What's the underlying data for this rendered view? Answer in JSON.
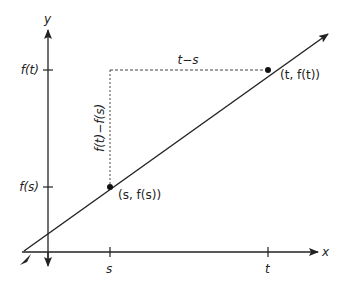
{
  "diagram": {
    "axes": {
      "x_label": "x",
      "y_label": "y"
    },
    "ticks": {
      "x": [
        {
          "label": "s"
        },
        {
          "label": "t"
        }
      ],
      "y": [
        {
          "label": "f(t)"
        },
        {
          "label": "f(s)"
        }
      ]
    },
    "points": [
      {
        "label": "(s, f(s))"
      },
      {
        "label": "(t, f(t))"
      }
    ],
    "annotations": {
      "horizontal_diff": "t−s",
      "vertical_diff": "f(t)−f(s)"
    },
    "colors": {
      "line": "#222222",
      "axis": "#222222",
      "dashed": "#444444"
    }
  }
}
